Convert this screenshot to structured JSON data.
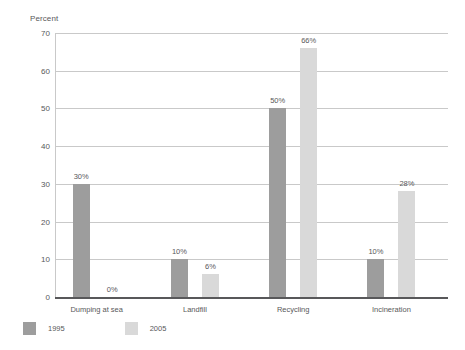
{
  "chart_data": {
    "type": "bar",
    "title": "",
    "ylabel": "Percent",
    "xlabel": "",
    "ylim": [
      0,
      70
    ],
    "yticks": [
      0,
      10,
      20,
      30,
      40,
      50,
      60,
      70
    ],
    "grid": true,
    "legend_position": "bottom-left",
    "categories": [
      "Dumping at sea",
      "Landfill",
      "Recycling",
      "Incineration"
    ],
    "series": [
      {
        "name": "1995",
        "color": "#9d9d9d",
        "values": [
          30,
          10,
          50,
          10
        ],
        "labels": [
          "30%",
          "10%",
          "50%",
          "10%"
        ]
      },
      {
        "name": "2005",
        "color": "#d9d9d9",
        "values": [
          0,
          6,
          66,
          28
        ],
        "labels": [
          "0%",
          "6%",
          "66%",
          "28%"
        ]
      }
    ]
  },
  "ticks": {
    "t0": "0",
    "t1": "10",
    "t2": "20",
    "t3": "30",
    "t4": "40",
    "t5": "50",
    "t6": "60",
    "t7": "70"
  },
  "axis": {
    "y_title": "Percent"
  },
  "groups": [
    {
      "label": "Dumping at sea",
      "bar1995": "30%",
      "bar2005": "0%"
    },
    {
      "label": "Landfill",
      "bar1995": "10%",
      "bar2005": "6%"
    },
    {
      "label": "Recycling",
      "bar1995": "50%",
      "bar2005": "66%"
    },
    {
      "label": "Incineration",
      "bar1995": "10%",
      "bar2005": "28%"
    }
  ],
  "legend": {
    "items": [
      {
        "label": "1995",
        "color": "#9d9d9d"
      },
      {
        "label": "2005",
        "color": "#d9d9d9"
      }
    ]
  }
}
